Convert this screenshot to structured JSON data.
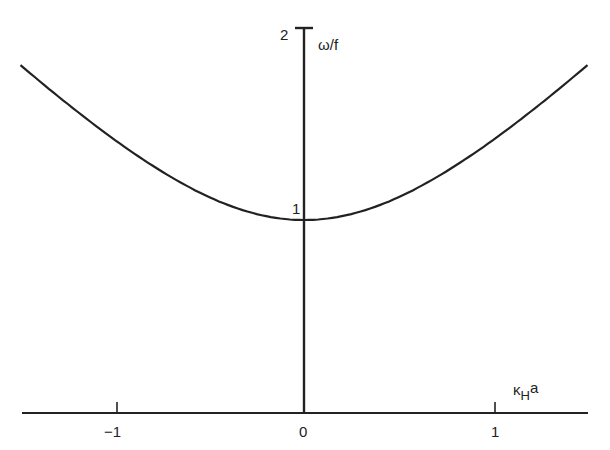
{
  "chart_data": {
    "type": "line",
    "title": "",
    "xlabel": "κ_H a",
    "ylabel": "ω/f",
    "xlim": [
      -1.5,
      1.5
    ],
    "ylim": [
      0,
      2
    ],
    "grid": false,
    "legend": null,
    "x_ticks": [
      -1,
      0,
      1
    ],
    "x_tick_labels": [
      "−1",
      "0",
      "1"
    ],
    "y_ticks": [
      1,
      2
    ],
    "y_tick_labels": [
      "1",
      "2"
    ],
    "series": [
      {
        "name": "dispersion curve ω/f = √(1 + (κ_H a)²)",
        "x": [
          -1.5,
          -1.25,
          -1.0,
          -0.75,
          -0.5,
          -0.25,
          0,
          0.25,
          0.5,
          0.75,
          1.0,
          1.25,
          1.5
        ],
        "y": [
          1.8,
          1.6,
          1.41,
          1.25,
          1.12,
          1.03,
          1.0,
          1.03,
          1.12,
          1.25,
          1.41,
          1.6,
          1.8
        ]
      }
    ]
  },
  "labels": {
    "ylabel": "ω/f",
    "xlabel_main": "κ",
    "xlabel_sub": "H",
    "xlabel_tail": "a",
    "ytick_1": "1",
    "ytick_2": "2",
    "xtick_neg1": "−1",
    "xtick_0": "0",
    "xtick_1": "1"
  }
}
